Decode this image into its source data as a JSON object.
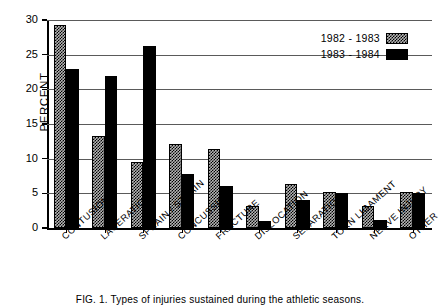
{
  "figure": {
    "caption": "FIG. 1.  Types of injuries sustained during the athletic seasons."
  },
  "chart_data": {
    "type": "bar",
    "title": "",
    "xlabel": "",
    "ylabel": "PERCENT",
    "ylim": [
      0,
      30
    ],
    "ytick_step": 5,
    "yticks": [
      0,
      5,
      10,
      15,
      20,
      25,
      30
    ],
    "ytick_labels": [
      "0",
      "5",
      "10",
      "15",
      "20",
      "25",
      "30"
    ],
    "grid": "horizontal",
    "legend_position": "top-right",
    "categories": [
      "CONTUSION",
      "LACERATION",
      "SPRAIN / STRAIN",
      "CONCUSSION",
      "FRACTURE",
      "DISLOCATION",
      "SEPARATION",
      "TORN LIGAMENT",
      "NERVE INJURY",
      "OTHER"
    ],
    "series": [
      {
        "name": "1982 - 1983",
        "fill": "checkered-gray",
        "color": "#b5b5b5",
        "values": [
          29.3,
          13.3,
          9.5,
          12.1,
          11.4,
          3.2,
          6.3,
          5.2,
          3.2,
          5.2
        ]
      },
      {
        "name": "1983 - 1984",
        "fill": "solid-black",
        "color": "#000000",
        "values": [
          23.0,
          21.9,
          26.2,
          7.8,
          6.1,
          1.0,
          4.0,
          5.1,
          1.2,
          5.0
        ]
      }
    ]
  }
}
